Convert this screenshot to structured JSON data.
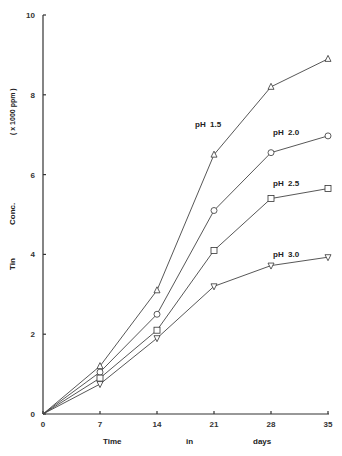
{
  "chart_data": {
    "type": "line",
    "title": "",
    "xlabel": "Time in days",
    "xlabel_parts": [
      "Time",
      "in",
      "days"
    ],
    "ylabel": "Tin Conc. ( x 1000 ppm )",
    "ylabel_parts": [
      "Tin",
      "Conc.",
      "( x 1000 ppm )"
    ],
    "xlim": [
      0,
      35
    ],
    "ylim": [
      0,
      10
    ],
    "x_ticks": [
      0,
      7,
      14,
      21,
      28,
      35
    ],
    "y_ticks": [
      0,
      2,
      4,
      6,
      8,
      10
    ],
    "grid": false,
    "legend_position": "inline labels near line ends",
    "x": [
      0,
      7,
      14,
      21,
      28,
      35
    ],
    "series": [
      {
        "name": "pH 1.5",
        "marker": "triangle-up",
        "values": [
          0,
          1.2,
          3.1,
          6.5,
          8.2,
          8.9
        ]
      },
      {
        "name": "pH 2.0",
        "marker": "circle",
        "values": [
          0,
          1.05,
          2.5,
          5.1,
          6.55,
          6.97
        ]
      },
      {
        "name": "pH 2.5",
        "marker": "square",
        "values": [
          0,
          0.9,
          2.1,
          4.1,
          5.4,
          5.65
        ]
      },
      {
        "name": "pH 3.0",
        "marker": "triangle-down",
        "values": [
          0,
          0.75,
          1.9,
          3.2,
          3.72,
          3.93
        ]
      }
    ]
  },
  "labels": {
    "series": [
      "pH  1.5",
      "pH  2.0",
      "pH  2.5",
      "pH  3.0"
    ],
    "x_ticks": [
      "0",
      "7",
      "14",
      "21",
      "28",
      "35"
    ],
    "y_ticks": [
      "0",
      "2",
      "4",
      "6",
      "8",
      "10"
    ],
    "x_title": [
      "Time",
      "in",
      "days"
    ],
    "y_title": [
      "Tin",
      "Conc.",
      "( x 1000 ppm )"
    ]
  }
}
